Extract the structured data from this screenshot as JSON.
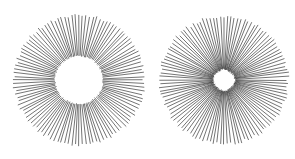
{
  "figure": {
    "background_color": "#ffffff",
    "line_color": "#000000",
    "canvas": {
      "width": 295,
      "height": 159
    },
    "panels": [
      {
        "name": "annulus-burst",
        "label": "left-figure",
        "description": "Radial spokes forming a ring with a clean circular white hole at the center",
        "center": {
          "x": 79,
          "y": 80
        },
        "outer_radius": 65,
        "inner_radius": 24,
        "inner_shape": "circle",
        "spoke_count": 112,
        "stroke_width": 0.55,
        "outer_radius_jitter": 1.6,
        "inner_radius_jitter": 0.7,
        "angle_jitter_deg": 0.5
      },
      {
        "name": "astroid-burst",
        "label": "right-figure",
        "description": "Radial spokes converging into a small dark diamond/astroid-shaped core",
        "center": {
          "x": 224,
          "y": 80
        },
        "outer_radius": 64,
        "inner_radius": 11,
        "inner_shape": "astroid",
        "astroid_exponent": 0.62,
        "spoke_count": 112,
        "stroke_width": 0.55,
        "outer_radius_jitter": 1.6,
        "inner_radius_jitter": 0.8,
        "angle_jitter_deg": 0.5
      }
    ]
  }
}
